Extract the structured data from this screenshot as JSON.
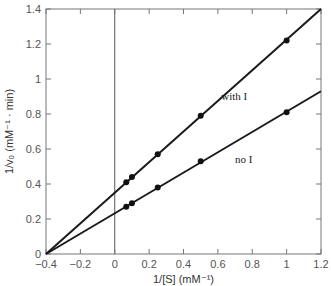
{
  "chart_data": {
    "type": "line",
    "title": "",
    "xlabel": "1/[S] (mM⁻¹)",
    "ylabel": "1/v₀ (mM⁻¹ · min)",
    "xlim": [
      -0.4,
      1.2
    ],
    "ylim": [
      0,
      1.4
    ],
    "xticks": [
      "-0.4",
      "-0.2",
      "0",
      "0.2",
      "0.4",
      "0.6",
      "0.8",
      "1",
      "1.2"
    ],
    "yticks": [
      "0",
      "0.2",
      "0.4",
      "0.6",
      "0.8",
      "1",
      "1.2",
      "1.4"
    ],
    "grid": false,
    "legend": "inline annotations",
    "series": [
      {
        "name": "with I",
        "x": [
          0.067,
          0.1,
          0.25,
          0.5,
          1.0
        ],
        "y": [
          0.41,
          0.44,
          0.57,
          0.79,
          1.22
        ],
        "line": {
          "x0": -0.4,
          "y0": 0.0,
          "x1": 1.2,
          "y1": 1.4
        }
      },
      {
        "name": "no I",
        "x": [
          0.067,
          0.1,
          0.25,
          0.5,
          1.0
        ],
        "y": [
          0.27,
          0.29,
          0.38,
          0.53,
          0.81
        ],
        "line": {
          "x0": -0.4,
          "y0": 0.0,
          "x1": 1.2,
          "y1": 0.93
        }
      }
    ],
    "annotations": [
      {
        "text": "with I",
        "x": 0.62,
        "y": 0.88
      },
      {
        "text": "no I",
        "x": 0.7,
        "y": 0.52
      }
    ]
  }
}
